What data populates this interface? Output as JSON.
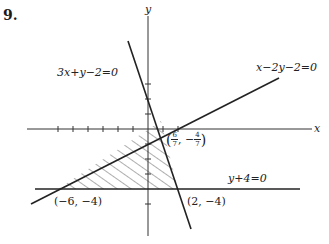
{
  "problem": {
    "number": "9."
  },
  "axes": {
    "x_label": "x",
    "y_label": "y"
  },
  "lines": [
    {
      "id": "line-a",
      "equation": "3x+y−2=0"
    },
    {
      "id": "line-b",
      "equation": "x−2y−2=0"
    },
    {
      "id": "line-c",
      "equation": "y+4=0"
    }
  ],
  "vertices": [
    {
      "id": "v1",
      "label": "(−6, −4)"
    },
    {
      "id": "v2",
      "label": "(2, −4)"
    },
    {
      "id": "v3",
      "label_num_x": "6",
      "label_den_x": "7",
      "label_num_y": "4",
      "label_den_y": "7",
      "label_sign_y": "−"
    }
  ],
  "region": {
    "shading": "diagonal hatch",
    "description": "triangle bounded by the three lines"
  },
  "colors": {
    "ink": "#222222",
    "background": "#ffffff"
  }
}
